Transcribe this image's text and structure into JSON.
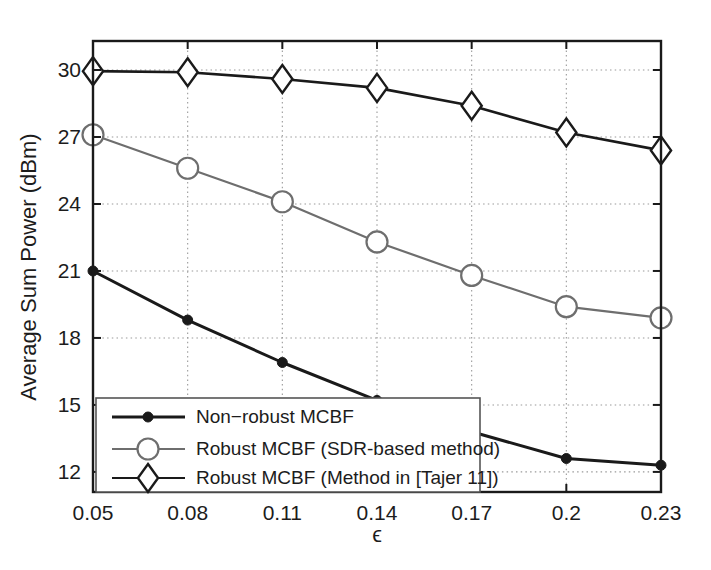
{
  "chart_data": {
    "type": "line",
    "title": "",
    "xlabel": "ϵ",
    "ylabel": "Average Sum Power (dBm)",
    "x": [
      0.05,
      0.08,
      0.11,
      0.14,
      0.17,
      0.2,
      0.23
    ],
    "xticklabels": [
      "0.05",
      "0.08",
      "0.11",
      "0.14",
      "0.17",
      "0.2",
      "0.23"
    ],
    "yticklabels": [
      "30",
      "27",
      "24",
      "21",
      "18",
      "15",
      "12"
    ],
    "yticks": [
      30,
      27,
      24,
      21,
      18,
      15,
      12
    ],
    "xlim": [
      0.05,
      0.23
    ],
    "ylim": [
      11.1,
      31.3
    ],
    "grid": true,
    "grid_style": "dotted",
    "legend_position": "lower-left",
    "series": [
      {
        "name": "Non−robust MCBF",
        "marker": "filled-circle",
        "color": "#1a1a1a",
        "values": [
          21.0,
          18.8,
          16.9,
          15.2,
          13.8,
          12.6,
          12.3
        ]
      },
      {
        "name": "Robust MCBF (SDR-based method)",
        "marker": "open-circle",
        "color": "#6e6e6e",
        "values": [
          27.1,
          25.6,
          24.1,
          22.3,
          20.8,
          19.4,
          18.9
        ]
      },
      {
        "name": "Robust MCBF (Method in [Tajer 11])",
        "marker": "open-diamond",
        "color": "#1a1a1a",
        "values": [
          29.95,
          29.9,
          29.6,
          29.2,
          28.4,
          27.2,
          26.4
        ]
      }
    ]
  },
  "axes": {
    "frame_color": "#1a1a1a",
    "grid_color": "#9a9a9a",
    "background": "#ffffff"
  },
  "legend": {
    "border_color": "#555555",
    "background": "#ffffff",
    "entries": [
      {
        "label": "Non−robust MCBF"
      },
      {
        "label": "Robust MCBF (SDR-based method)"
      },
      {
        "label": "Robust MCBF (Method in [Tajer 11])"
      }
    ]
  }
}
